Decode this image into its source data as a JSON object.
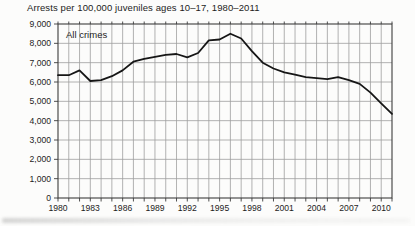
{
  "chart_data": {
    "type": "line",
    "title": "Arrests per 100,000 juveniles ages 10–17, 1980–2011",
    "series_label": "All crimes",
    "x": [
      1980,
      1981,
      1982,
      1983,
      1984,
      1985,
      1986,
      1987,
      1988,
      1989,
      1990,
      1991,
      1992,
      1993,
      1994,
      1995,
      1996,
      1997,
      1998,
      1999,
      2000,
      2001,
      2002,
      2003,
      2004,
      2005,
      2006,
      2007,
      2008,
      2009,
      2010,
      2011
    ],
    "values": [
      6350,
      6350,
      6600,
      6050,
      6100,
      6300,
      6600,
      7050,
      7200,
      7300,
      7400,
      7450,
      7280,
      7500,
      8150,
      8200,
      8500,
      8250,
      7600,
      7000,
      6700,
      6500,
      6380,
      6250,
      6200,
      6150,
      6250,
      6100,
      5900,
      5450,
      4900,
      4350
    ],
    "xlabel": "",
    "ylabel": "",
    "xlim": [
      1980,
      2011
    ],
    "ylim": [
      0,
      9000
    ],
    "y_tick_step": 1000,
    "y_tick_labels": [
      "0",
      "1,000",
      "2,000",
      "3,000",
      "4,000",
      "5,000",
      "6,000",
      "7,000",
      "8,000",
      "9,000"
    ],
    "x_tick_years": [
      1980,
      1983,
      1986,
      1989,
      1992,
      1995,
      1998,
      2001,
      2004,
      2007,
      2010
    ],
    "x_tick_labels": [
      "1980",
      "1983",
      "1986",
      "1989",
      "1992",
      "1995",
      "1998",
      "2001",
      "2004",
      "2007",
      "2010"
    ],
    "grid": "both",
    "legend_position": "none",
    "colors": {
      "line": "#161616",
      "grid": "#9e9e9e",
      "frame": "#3c3c3c",
      "text": "#1c1c1c",
      "background": "#fcfcfb"
    }
  }
}
